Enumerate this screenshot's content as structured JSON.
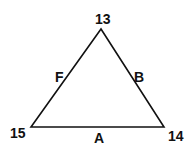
{
  "diagram": {
    "type": "triangle",
    "vertices": [
      {
        "id": "top",
        "label": "13"
      },
      {
        "id": "bottom_left",
        "label": "15"
      },
      {
        "id": "bottom_right",
        "label": "14"
      }
    ],
    "edges": [
      {
        "id": "left",
        "label": "F",
        "from": "15",
        "to": "13"
      },
      {
        "id": "right",
        "label": "B",
        "from": "13",
        "to": "14"
      },
      {
        "id": "bottom",
        "label": "A",
        "from": "15",
        "to": "14"
      }
    ],
    "stroke_color": "#111111"
  }
}
